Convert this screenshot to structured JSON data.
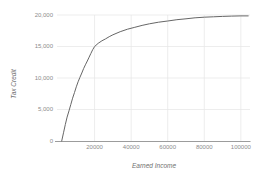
{
  "chart_data": {
    "type": "line",
    "title": "",
    "xlabel": "Earned Income",
    "ylabel": "Tax Credit",
    "xlim": [
      0,
      105000
    ],
    "ylim": [
      0,
      20000
    ],
    "grid": true,
    "legend": "none",
    "xticks": [
      {
        "value": 20000,
        "label": "20000"
      },
      {
        "value": 40000,
        "label": "40000"
      },
      {
        "value": 60000,
        "label": "60000"
      },
      {
        "value": 80000,
        "label": "80000"
      },
      {
        "value": 100000,
        "label": "100000"
      }
    ],
    "yticks": [
      {
        "value": 0,
        "label": "0"
      },
      {
        "value": 5000,
        "label": "5,000"
      },
      {
        "value": 10000,
        "label": "10,000"
      },
      {
        "value": 15000,
        "label": "15,000"
      },
      {
        "value": 20000,
        "label": "20,000"
      }
    ],
    "series": [
      {
        "name": "tax-credit-curve",
        "points": [
          [
            2000,
            0
          ],
          [
            3000,
            1300
          ],
          [
            4000,
            2600
          ],
          [
            5000,
            3800
          ],
          [
            6000,
            4800
          ],
          [
            7000,
            5800
          ],
          [
            8000,
            6800
          ],
          [
            9000,
            7700
          ],
          [
            10000,
            8600
          ],
          [
            11000,
            9400
          ],
          [
            12000,
            10100
          ],
          [
            13000,
            10800
          ],
          [
            14000,
            11500
          ],
          [
            15000,
            12100
          ],
          [
            16000,
            12700
          ],
          [
            17000,
            13300
          ],
          [
            18000,
            13900
          ],
          [
            19000,
            14500
          ],
          [
            20000,
            15000
          ],
          [
            22000,
            15500
          ],
          [
            24000,
            15900
          ],
          [
            26000,
            16200
          ],
          [
            28000,
            16550
          ],
          [
            30000,
            16850
          ],
          [
            34000,
            17350
          ],
          [
            38000,
            17750
          ],
          [
            42000,
            18050
          ],
          [
            46000,
            18350
          ],
          [
            50000,
            18600
          ],
          [
            55000,
            18850
          ],
          [
            60000,
            19050
          ],
          [
            65000,
            19250
          ],
          [
            70000,
            19400
          ],
          [
            75000,
            19550
          ],
          [
            80000,
            19650
          ],
          [
            85000,
            19720
          ],
          [
            90000,
            19780
          ],
          [
            95000,
            19820
          ],
          [
            100000,
            19850
          ],
          [
            104000,
            19860
          ]
        ]
      }
    ],
    "colors": {
      "background": "#ffffff",
      "curve": "#666666",
      "grid": "#e7e7e7",
      "axis": "#9c9c9c",
      "tick_label": "#8c8c8c",
      "axis_title": "#707070"
    }
  }
}
